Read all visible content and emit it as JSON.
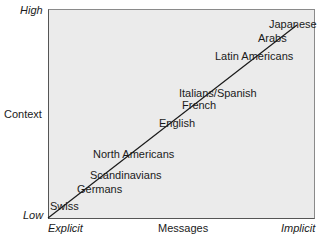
{
  "axes": {
    "y_label": "Context",
    "y_high": "High",
    "y_low": "Low",
    "x_label": "Messages",
    "x_left": "Explicit",
    "x_right": "Implicit"
  },
  "colors": {
    "plot_bg": "#ebebeb",
    "line": "#1a1a1a",
    "border": "#555555"
  },
  "chart_data": {
    "type": "scatter",
    "title": "",
    "xlabel": "Messages (Explicit → Implicit)",
    "ylabel": "Context (Low → High)",
    "grid": false,
    "trend_line": true,
    "points": [
      {
        "label": "Swiss",
        "x": 0.04,
        "y": 0.07
      },
      {
        "label": "Germans",
        "x": 0.15,
        "y": 0.15
      },
      {
        "label": "Scandinavians",
        "x": 0.22,
        "y": 0.22
      },
      {
        "label": "North Americans",
        "x": 0.28,
        "y": 0.32
      },
      {
        "label": "English",
        "x": 0.43,
        "y": 0.46
      },
      {
        "label": "French",
        "x": 0.52,
        "y": 0.55
      },
      {
        "label": "Italians/Spanish",
        "x": 0.55,
        "y": 0.61
      },
      {
        "label": "Latin Americans",
        "x": 0.7,
        "y": 0.77
      },
      {
        "label": "Arabs",
        "x": 0.87,
        "y": 0.86
      },
      {
        "label": "Japanese",
        "x": 0.96,
        "y": 0.93
      }
    ]
  },
  "labels": [
    {
      "text": "Japanese",
      "left": 269,
      "top": 18
    },
    {
      "text": "Arabs",
      "left": 258,
      "top": 32
    },
    {
      "text": "Latin Americans",
      "left": 215,
      "top": 50
    },
    {
      "text": "Italians/Spanish",
      "left": 179,
      "top": 87
    },
    {
      "text": "French",
      "left": 182,
      "top": 99
    },
    {
      "text": "English",
      "left": 159,
      "top": 117
    },
    {
      "text": "North Americans",
      "left": 93,
      "top": 148
    },
    {
      "text": "Scandinavians",
      "left": 90,
      "top": 169
    },
    {
      "text": "Germans",
      "left": 77,
      "top": 183
    },
    {
      "text": "Swiss",
      "left": 50,
      "top": 200
    }
  ]
}
